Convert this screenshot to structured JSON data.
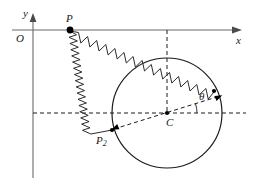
{
  "figure": {
    "labels": {
      "y_axis": "y",
      "x_axis": "x",
      "origin": "O",
      "point_p": "P",
      "point_p2_base": "P",
      "point_p2_sub": "2",
      "center": "C",
      "angle": "θ"
    },
    "colors": {
      "axis": "#6b6b6b",
      "stroke": "#1a1a1a",
      "spring": "#2b2b2b",
      "node": "#000000",
      "background": "#ffffff"
    },
    "geometry": {
      "origin": {
        "x": 33,
        "y": 30
      },
      "y_axis": {
        "x": 33,
        "y_top": 14,
        "y_bottom": 178
      },
      "x_axis": {
        "y": 30,
        "x_left": 12,
        "x_right": 242
      },
      "point_p": {
        "x": 70,
        "y": 30
      },
      "point_p2": {
        "x": 112,
        "y": 130
      },
      "center_c": {
        "x": 167,
        "y": 113
      },
      "circle_radius": 55,
      "spring_end_right": {
        "x": 213,
        "y": 88
      },
      "dashed_horizontal": {
        "y": 113,
        "x_left": 33,
        "x_right": 246
      },
      "dashed_vertical": {
        "x": 167,
        "y_top": 30,
        "y_bottom": 113
      },
      "angle_degrees": 18
    }
  }
}
